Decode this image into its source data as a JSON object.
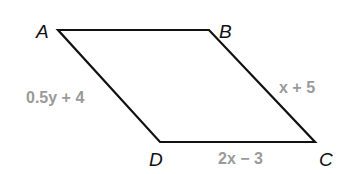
{
  "diagram": {
    "type": "parallelogram",
    "vertices": [
      {
        "name": "A",
        "x": 58,
        "y": 30
      },
      {
        "name": "B",
        "x": 209,
        "y": 30
      },
      {
        "name": "C",
        "x": 315,
        "y": 142
      },
      {
        "name": "D",
        "x": 160,
        "y": 142
      }
    ],
    "vertex_labels": {
      "A": "A",
      "B": "B",
      "C": "C",
      "D": "D"
    },
    "side_labels": {
      "AD": "0.5y + 4",
      "BC": "x + 5",
      "DC": "2x − 3"
    },
    "colors": {
      "stroke": "#111111",
      "vertex_label": "#111111",
      "side_label": "#9a9a9a",
      "background": "#ffffff"
    }
  }
}
